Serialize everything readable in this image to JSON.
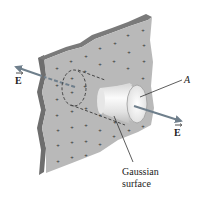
{
  "figure": {
    "labels": {
      "field_left": "E",
      "field_right": "E",
      "end_cap": "A",
      "gaussian_line1": "Gaussian",
      "gaussian_line2": "surface"
    },
    "charge_symbol": "+",
    "colors": {
      "plate_face": "#b9b9b9",
      "plate_edge": "#6e6e6e",
      "arrow": "#6f7f8c",
      "cylinder_light": "#f4f4f4",
      "cylinder_shade": "#c8c8c8",
      "dash": "#444444",
      "text": "#222222"
    }
  }
}
